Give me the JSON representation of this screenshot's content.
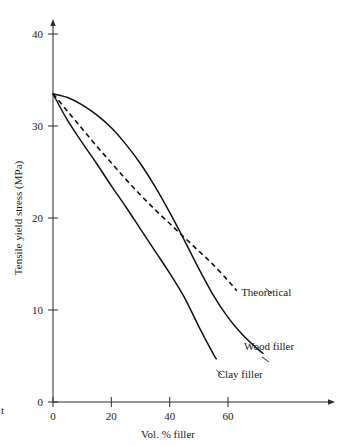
{
  "chart_data": {
    "type": "line",
    "title": "",
    "xlabel": "Vol. % filler",
    "ylabel": "Tensile yield stress  (MPa)",
    "xlim": [
      0,
      76
    ],
    "ylim": [
      0,
      41
    ],
    "xticks": [
      0,
      20,
      40,
      60
    ],
    "yticks": [
      0,
      10,
      20,
      30,
      40
    ],
    "xtick_labels": [
      "0",
      "20",
      "40",
      "60"
    ],
    "ytick_labels": [
      "0",
      "10",
      "20",
      "30",
      "40"
    ],
    "grid": false,
    "legend_position": "inline-end-of-curve",
    "origin_point": {
      "x": 0,
      "y": 33.5
    },
    "series": [
      {
        "name": "Theoretical",
        "style": "dashed",
        "label": "Theoretical",
        "label_x": 64.5,
        "label_y": 11.5,
        "x": [
          0,
          5,
          10,
          15,
          20,
          25,
          30,
          35,
          40,
          45,
          50,
          55,
          60,
          63
        ],
        "y": [
          33.5,
          31.6,
          29.7,
          27.8,
          26.0,
          24.2,
          22.5,
          20.9,
          19.4,
          17.9,
          16.4,
          14.9,
          13.2,
          12.1
        ]
      },
      {
        "name": "Wood filler",
        "style": "solid",
        "label": "Wood filler",
        "label_x": 65.5,
        "label_y": 5.6,
        "x": [
          0,
          5,
          10,
          15,
          20,
          25,
          30,
          35,
          40,
          45,
          50,
          55,
          60,
          65,
          70,
          72
        ],
        "y": [
          33.5,
          33.1,
          32.3,
          31.2,
          29.8,
          28.0,
          25.9,
          23.4,
          20.6,
          17.6,
          14.5,
          11.6,
          9.2,
          7.3,
          5.8,
          5.3
        ]
      },
      {
        "name": "Clay filler",
        "style": "solid",
        "label": "Clay filler",
        "label_x": 56.5,
        "label_y": 2.6,
        "x": [
          0,
          5,
          10,
          15,
          20,
          25,
          30,
          35,
          40,
          45,
          50,
          55,
          56
        ],
        "y": [
          33.5,
          30.6,
          28.2,
          25.9,
          23.5,
          21.2,
          18.8,
          16.4,
          14.0,
          11.4,
          8.2,
          5.2,
          4.7
        ]
      }
    ],
    "annotations": [
      {
        "text": "Theoretical",
        "series": "Theoretical"
      },
      {
        "text": "Wood filler",
        "series": "Wood filler"
      },
      {
        "text": "Clay filler",
        "series": "Clay filler"
      }
    ],
    "intersections": [
      {
        "between": [
          "Wood filler",
          "Theoretical"
        ],
        "x": 37,
        "y": 21.3
      },
      {
        "between": [
          "Wood filler",
          "Clay filler"
        ],
        "x": 53,
        "y": 8.5
      }
    ]
  },
  "caption_fragment": "t"
}
